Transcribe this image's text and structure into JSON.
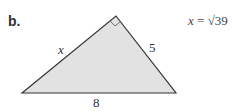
{
  "problem": {
    "label": "b.",
    "answer_var": "x",
    "answer_eq": " = ",
    "answer_value": "√39"
  },
  "triangle": {
    "side_left_label": "x",
    "side_right_label": "5",
    "side_bottom_label": "8",
    "fill_color": "#e2e2e2",
    "stroke_color": "#333333"
  }
}
